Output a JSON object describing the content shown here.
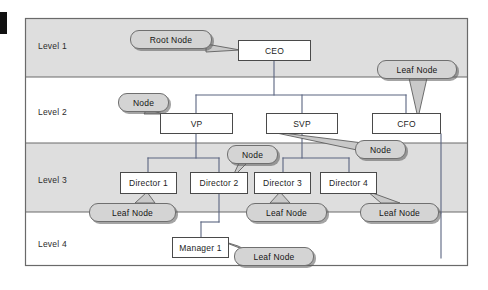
{
  "diagram": {
    "frame": {
      "x": 25,
      "y": 18,
      "width": 443,
      "height": 248
    },
    "colors": {
      "band_shaded": "#dedede",
      "band_plain": "#ffffff",
      "box_fill": "#ffffff",
      "box_stroke": "#4a4a4a",
      "callout_fill": "#d4d4d4",
      "callout_stroke": "#6f6f6f",
      "callout_shadow": "#5a5a5a",
      "connector": "#55607a",
      "text": "#1d1d1d"
    },
    "levels": [
      {
        "label": "Level 1",
        "shaded": true,
        "x": 38,
        "y": 45,
        "band_y": 18,
        "band_h": 59
      },
      {
        "label": "Level 2",
        "shaded": false,
        "x": 38,
        "y": 111,
        "band_y": 77,
        "band_h": 66
      },
      {
        "label": "Level 3",
        "shaded": true,
        "x": 38,
        "y": 179,
        "band_y": 143,
        "band_h": 69
      },
      {
        "label": "Level 4",
        "shaded": false,
        "x": 38,
        "y": 243,
        "band_y": 212,
        "band_h": 54
      }
    ],
    "nodes": [
      {
        "id": "ceo",
        "label": "CEO",
        "x": 238,
        "y": 40,
        "w": 73,
        "h": 21,
        "level": 1
      },
      {
        "id": "vp",
        "label": "VP",
        "x": 160,
        "y": 113,
        "w": 73,
        "h": 21,
        "level": 2
      },
      {
        "id": "svp",
        "label": "SVP",
        "x": 266,
        "y": 113,
        "w": 72,
        "h": 21,
        "level": 2
      },
      {
        "id": "cfo",
        "label": "CFO",
        "x": 372,
        "y": 113,
        "w": 69,
        "h": 21,
        "level": 2
      },
      {
        "id": "director1",
        "label": "Director 1",
        "x": 120,
        "y": 172,
        "w": 57,
        "h": 22,
        "level": 3
      },
      {
        "id": "director2",
        "label": "Director 2",
        "x": 190,
        "y": 172,
        "w": 58,
        "h": 22,
        "level": 3
      },
      {
        "id": "director3",
        "label": "Director 3",
        "x": 254,
        "y": 172,
        "w": 57,
        "h": 22,
        "level": 3
      },
      {
        "id": "director4",
        "label": "Director 4",
        "x": 320,
        "y": 172,
        "w": 57,
        "h": 22,
        "level": 3
      },
      {
        "id": "manager1",
        "label": "Manager 1",
        "x": 172,
        "y": 237,
        "w": 57,
        "h": 21,
        "level": 4
      }
    ],
    "callouts": [
      {
        "id": "root-node",
        "label": "Root Node",
        "x": 130,
        "y": 30,
        "w": 82,
        "h": 19,
        "target": "ceo"
      },
      {
        "id": "leaf-cfo",
        "label": "Leaf Node",
        "x": 377,
        "y": 60,
        "w": 80,
        "h": 19,
        "target": "cfo"
      },
      {
        "id": "node-vp",
        "label": "Node",
        "x": 118,
        "y": 93,
        "w": 51,
        "h": 19,
        "target": "vp"
      },
      {
        "id": "node-d2",
        "label": "Node",
        "x": 227,
        "y": 145,
        "w": 51,
        "h": 19,
        "target": "director2"
      },
      {
        "id": "node-svp",
        "label": "Node",
        "x": 355,
        "y": 140,
        "w": 51,
        "h": 19,
        "target": "svp"
      },
      {
        "id": "leaf-d1",
        "label": "Leaf Node",
        "x": 89,
        "y": 203,
        "w": 87,
        "h": 19,
        "target": "director1"
      },
      {
        "id": "leaf-d3",
        "label": "Leaf Node",
        "x": 246,
        "y": 203,
        "w": 81,
        "h": 19,
        "target": "director3"
      },
      {
        "id": "leaf-d4",
        "label": "Leaf Node",
        "x": 360,
        "y": 203,
        "w": 79,
        "h": 19,
        "target": "director4"
      },
      {
        "id": "leaf-mgr",
        "label": "Leaf Node",
        "x": 234,
        "y": 247,
        "w": 80,
        "h": 19,
        "target": "manager1"
      }
    ],
    "edges": [
      {
        "from": "ceo",
        "to": "vp"
      },
      {
        "from": "ceo",
        "to": "svp"
      },
      {
        "from": "ceo",
        "to": "cfo"
      },
      {
        "from": "vp",
        "to": "director1"
      },
      {
        "from": "vp",
        "to": "director2"
      },
      {
        "from": "svp",
        "to": "director3"
      },
      {
        "from": "svp",
        "to": "director4"
      },
      {
        "from": "director2",
        "to": "manager1"
      }
    ]
  }
}
